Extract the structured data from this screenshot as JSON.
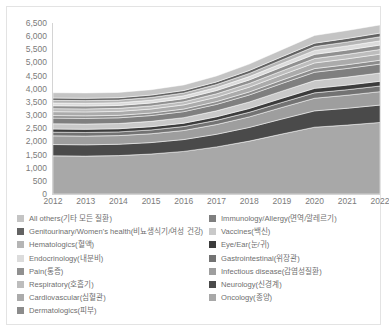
{
  "chart_data": {
    "type": "area",
    "title": "",
    "xlabel": "",
    "ylabel": "",
    "stacked": true,
    "grid": false,
    "legend_position": "bottom",
    "x": [
      2012,
      2013,
      2014,
      2015,
      2016,
      2017,
      2018,
      2019,
      2020,
      2021,
      2022
    ],
    "categories": [
      "2012",
      "2013",
      "2014",
      "2015",
      "2016",
      "2017",
      "2018",
      "2019",
      "2020",
      "2021",
      "2022"
    ],
    "ylim": [
      0,
      6500
    ],
    "yticks": [
      0,
      500,
      1000,
      1500,
      2000,
      2500,
      3000,
      3500,
      4000,
      4500,
      5000,
      5500,
      6000,
      6500
    ],
    "ytick_labels": [
      "0",
      "500",
      "1,000",
      "1,500",
      "2,000",
      "2,500",
      "3,000",
      "3,500",
      "4,000",
      "4,500",
      "5,000",
      "5,500",
      "6,000",
      "6,500"
    ],
    "series": [
      {
        "name": "Oncology(종양)",
        "color": "#a8a8a8",
        "values": [
          1450,
          1440,
          1460,
          1520,
          1620,
          1790,
          2010,
          2280,
          2540,
          2620,
          2720
        ]
      },
      {
        "name": "Neurology(신경계)",
        "color": "#4a4a4a",
        "values": [
          430,
          430,
          430,
          435,
          450,
          480,
          520,
          570,
          620,
          640,
          660
        ]
      },
      {
        "name": "Infectious disease(감염성질환)",
        "color": "#9e9e9e",
        "values": [
          330,
          330,
          330,
          335,
          345,
          370,
          400,
          440,
          480,
          495,
          510
        ]
      },
      {
        "name": "Gastrointestinal(위장관)",
        "color": "#737373",
        "values": [
          140,
          140,
          140,
          145,
          150,
          160,
          175,
          190,
          205,
          210,
          215
        ]
      },
      {
        "name": "Eye/Ear(눈/귀)",
        "color": "#3c3c3c",
        "values": [
          120,
          120,
          120,
          122,
          126,
          134,
          145,
          158,
          170,
          175,
          180
        ]
      },
      {
        "name": "Vaccines(백신)",
        "color": "#c9c9c9",
        "values": [
          200,
          200,
          200,
          205,
          212,
          228,
          248,
          272,
          296,
          305,
          315
        ]
      },
      {
        "name": "Immunology/Allergy(면역/알레르기)",
        "color": "#7f7f7f",
        "values": [
          215,
          215,
          215,
          220,
          228,
          244,
          266,
          292,
          318,
          328,
          338
        ]
      },
      {
        "name": "Dermatologics(피부)",
        "color": "#8c8c8c",
        "values": [
          95,
          95,
          95,
          97,
          100,
          107,
          116,
          127,
          138,
          143,
          147
        ]
      },
      {
        "name": "Cardiovascular(심혈관)",
        "color": "#ababab",
        "values": [
          150,
          150,
          150,
          152,
          157,
          167,
          182,
          198,
          216,
          222,
          230
        ]
      },
      {
        "name": "Respiratory(호흡기)",
        "color": "#bdbdbd",
        "values": [
          115,
          115,
          115,
          117,
          121,
          129,
          140,
          153,
          166,
          172,
          177
        ]
      },
      {
        "name": "Pain(통증)",
        "color": "#909090",
        "values": [
          110,
          110,
          110,
          112,
          115,
          123,
          133,
          146,
          159,
          164,
          169
        ]
      },
      {
        "name": "Endocrinology(내분비)",
        "color": "#dcdcdc",
        "values": [
          105,
          105,
          105,
          107,
          110,
          117,
          127,
          139,
          151,
          156,
          161
        ]
      },
      {
        "name": "Hematologics(혈액)",
        "color": "#b5b5b5",
        "values": [
          100,
          100,
          100,
          102,
          105,
          112,
          122,
          133,
          145,
          150,
          155
        ]
      },
      {
        "name": "Genitourinary/Women's health(비뇨생식기/여성 건강)",
        "color": "#636363",
        "values": [
          90,
          90,
          90,
          92,
          95,
          101,
          110,
          120,
          131,
          135,
          139
        ]
      },
      {
        "name": "All others(기타 모든 질환)",
        "color": "#c4c4c4",
        "values": [
          200,
          200,
          200,
          204,
          211,
          225,
          245,
          268,
          292,
          301,
          311
        ]
      }
    ]
  },
  "legend": {
    "left": [
      {
        "label": "All others(기타 모든 질환)",
        "color": "#c4c4c4"
      },
      {
        "label": "Genitourinary/Women's health(비뇨생식기/여성 건강)",
        "color": "#636363"
      },
      {
        "label": "Hematologics(혈액)",
        "color": "#b5b5b5"
      },
      {
        "label": "Endocrinology(내분비)",
        "color": "#dcdcdc"
      },
      {
        "label": "Pain(통증)",
        "color": "#909090"
      },
      {
        "label": "Respiratory(호흡기)",
        "color": "#bdbdbd"
      },
      {
        "label": "Cardiovascular(심혈관)",
        "color": "#ababab"
      },
      {
        "label": "Dermatologics(피부)",
        "color": "#8c8c8c"
      }
    ],
    "right": [
      {
        "label": "Immunology/Allergy(면역/알레르기)",
        "color": "#7f7f7f"
      },
      {
        "label": "Vaccines(백신)",
        "color": "#c9c9c9"
      },
      {
        "label": "Eye/Ear(눈/귀)",
        "color": "#3c3c3c"
      },
      {
        "label": "Gastrointestinal(위장관)",
        "color": "#737373"
      },
      {
        "label": "Infectious disease(감염성질환)",
        "color": "#9e9e9e"
      },
      {
        "label": "Neurology(신경계)",
        "color": "#4a4a4a"
      },
      {
        "label": "Oncology(종양)",
        "color": "#a8a8a8"
      }
    ]
  }
}
